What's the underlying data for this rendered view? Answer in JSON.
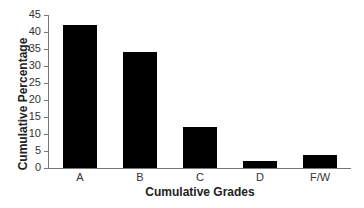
{
  "chart_data": {
    "type": "bar",
    "title": "",
    "xlabel": "Cumulative Grades",
    "ylabel": "Cumulative Percentage",
    "categories": [
      "A",
      "B",
      "C",
      "D",
      "F/W"
    ],
    "values": [
      42,
      34,
      12,
      2,
      3.7
    ],
    "ylim": [
      0,
      45
    ],
    "yticks": [
      0,
      5,
      10,
      15,
      20,
      25,
      30,
      35,
      40,
      45
    ],
    "grid": false,
    "legend": null,
    "bar_color": "#000000"
  }
}
